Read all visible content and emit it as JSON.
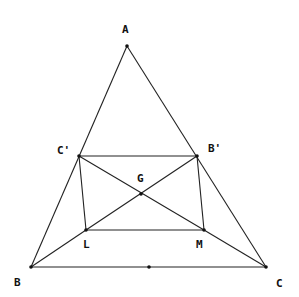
{
  "diagram": {
    "type": "geometry",
    "points": {
      "A": {
        "label": "A",
        "x": 127,
        "y": 46,
        "lx": 122,
        "ly": 33
      },
      "B": {
        "label": "B",
        "x": 31,
        "y": 267,
        "lx": 14,
        "ly": 286
      },
      "C": {
        "label": "C",
        "x": 266,
        "y": 267,
        "lx": 276,
        "ly": 287
      },
      "Cp": {
        "label": "C'",
        "x": 79,
        "y": 156,
        "lx": 57,
        "ly": 154
      },
      "Bp": {
        "label": "B'",
        "x": 197,
        "y": 156,
        "lx": 208,
        "ly": 152
      },
      "G": {
        "label": "G",
        "x": 141,
        "y": 194,
        "lx": 137,
        "ly": 182
      },
      "L": {
        "label": "L",
        "x": 86,
        "y": 230,
        "lx": 83,
        "ly": 248
      },
      "M": {
        "label": "M",
        "x": 204,
        "y": 230,
        "lx": 196,
        "ly": 248
      },
      "Mid": {
        "label": "",
        "x": 149,
        "y": 267,
        "lx": 0,
        "ly": 0
      }
    },
    "segments": [
      [
        "A",
        "B"
      ],
      [
        "A",
        "C"
      ],
      [
        "B",
        "C"
      ],
      [
        "Cp",
        "Bp"
      ],
      [
        "Cp",
        "L"
      ],
      [
        "Bp",
        "M"
      ],
      [
        "L",
        "M"
      ],
      [
        "Cp",
        "M"
      ],
      [
        "Bp",
        "L"
      ],
      [
        "B",
        "L"
      ],
      [
        "M",
        "C"
      ]
    ]
  }
}
